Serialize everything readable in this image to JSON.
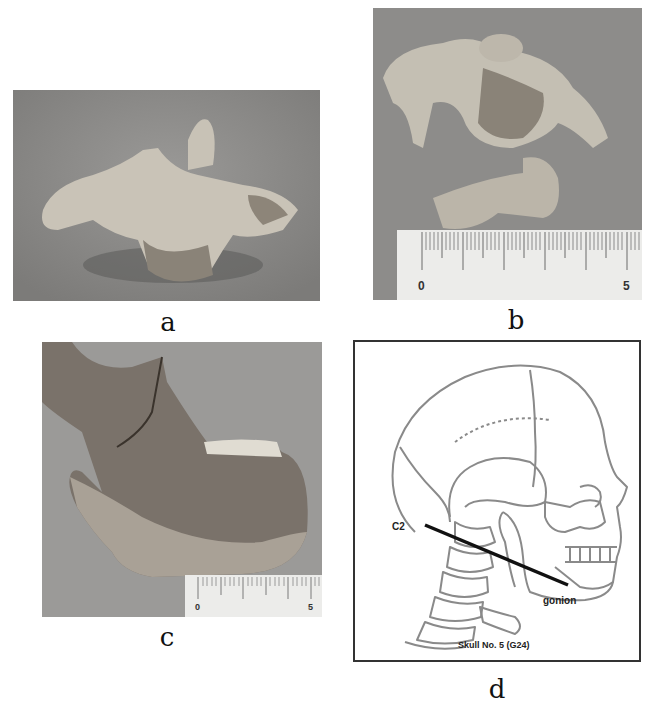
{
  "figure": {
    "panels": [
      {
        "id": "a",
        "label": "a",
        "type": "photograph",
        "subject": "C2 vertebra (axis), lateral view"
      },
      {
        "id": "b",
        "label": "b",
        "type": "photograph",
        "subject": "C2 vertebra with scale",
        "ruler": {
          "start": "0",
          "end": "5"
        }
      },
      {
        "id": "c",
        "label": "c",
        "type": "photograph",
        "subject": "Mandible fragment, lateral view",
        "ruler": {
          "start": "0",
          "end": "5"
        }
      },
      {
        "id": "d",
        "label": "d",
        "type": "diagram",
        "subject": "Skull and cervical spine line drawing",
        "annotations": {
          "c2": "C2",
          "gonion": "gonion",
          "caption": "Skull No. 5 (G24)"
        }
      }
    ]
  },
  "colors": {
    "photo_bg": "#8c8c8a",
    "bone": "#cfc9bd",
    "line_art": "#8a8a8a",
    "line_black": "#111111"
  }
}
